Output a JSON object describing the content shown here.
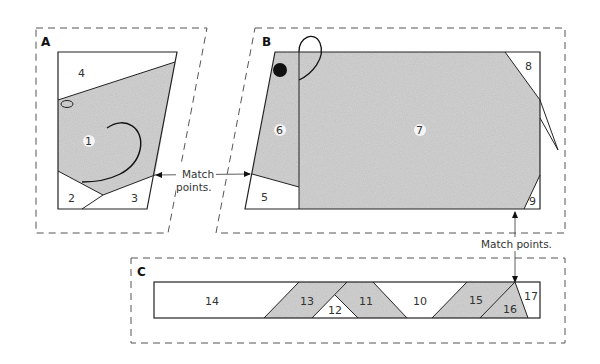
{
  "sections": {
    "a": {
      "label": "A"
    },
    "b": {
      "label": "B"
    },
    "c": {
      "label": "C"
    }
  },
  "pieces": {
    "p1": "1",
    "p2": "2",
    "p3": "3",
    "p4": "4",
    "p5": "5",
    "p6": "6",
    "p7": "7",
    "p8": "8",
    "p9": "9",
    "p10": "10",
    "p11": "11",
    "p12": "12",
    "p13": "13",
    "p14": "14",
    "p15": "15",
    "p16": "16",
    "p17": "17"
  },
  "annotations": {
    "match_ab_line1": "Match",
    "match_ab_line2": "points.",
    "match_bc": "Match points."
  },
  "colors": {
    "fabric_fill": "#c4c4c4",
    "outline": "#222222",
    "dash": "#555555"
  }
}
